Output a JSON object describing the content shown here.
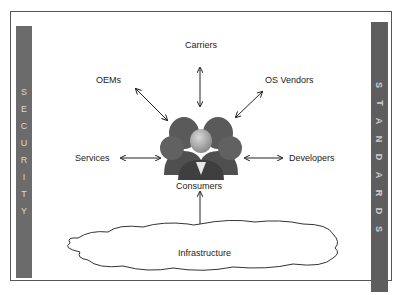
{
  "diagram": {
    "left_bar": {
      "label": "SECURITY",
      "letters": [
        "S",
        "E",
        "C",
        "U",
        "R",
        "I",
        "T",
        "Y"
      ]
    },
    "right_bar": {
      "label": "STANDARDS",
      "letters": [
        "S",
        "T",
        "A",
        "N",
        "D",
        "A",
        "R",
        "D",
        "S"
      ]
    },
    "center": {
      "label": "Consumers",
      "icon": "people-group-icon"
    },
    "nodes": [
      {
        "id": "carriers",
        "label": "Carriers"
      },
      {
        "id": "oems",
        "label": "OEMs"
      },
      {
        "id": "os_vendors",
        "label": "OS Vendors"
      },
      {
        "id": "services",
        "label": "Services"
      },
      {
        "id": "developers",
        "label": "Developers"
      },
      {
        "id": "infrastructure",
        "label": "Infrastructure",
        "shape": "cloud"
      }
    ],
    "edges": [
      {
        "from": "consumers",
        "to": "carriers",
        "type": "bidirectional"
      },
      {
        "from": "consumers",
        "to": "oems",
        "type": "bidirectional"
      },
      {
        "from": "consumers",
        "to": "os_vendors",
        "type": "bidirectional"
      },
      {
        "from": "consumers",
        "to": "services",
        "type": "bidirectional"
      },
      {
        "from": "consumers",
        "to": "developers",
        "type": "bidirectional"
      },
      {
        "from": "consumers",
        "to": "infrastructure",
        "type": "bidirectional"
      }
    ]
  }
}
